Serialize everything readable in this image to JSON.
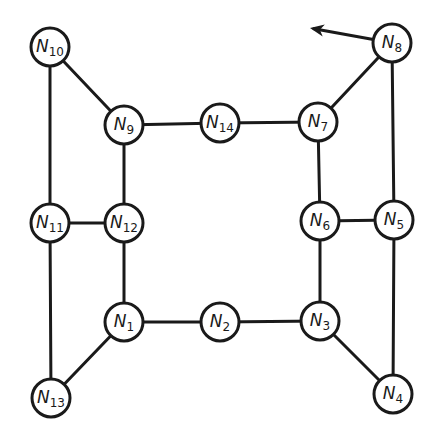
{
  "diagram": {
    "type": "graph",
    "nodes": [
      {
        "id": "N1",
        "label": "N",
        "sub": "1",
        "x": 124,
        "y": 322
      },
      {
        "id": "N2",
        "label": "N",
        "sub": "2",
        "x": 220,
        "y": 322
      },
      {
        "id": "N3",
        "label": "N",
        "sub": "3",
        "x": 320,
        "y": 321
      },
      {
        "id": "N4",
        "label": "N",
        "sub": "4",
        "x": 393,
        "y": 394
      },
      {
        "id": "N5",
        "label": "N",
        "sub": "5",
        "x": 394,
        "y": 220
      },
      {
        "id": "N6",
        "label": "N",
        "sub": "6",
        "x": 320,
        "y": 221
      },
      {
        "id": "N7",
        "label": "N",
        "sub": "7",
        "x": 318,
        "y": 122
      },
      {
        "id": "N8",
        "label": "N",
        "sub": "8",
        "x": 392,
        "y": 43
      },
      {
        "id": "N9",
        "label": "N",
        "sub": "9",
        "x": 124,
        "y": 125
      },
      {
        "id": "N10",
        "label": "N",
        "sub": "10",
        "x": 50,
        "y": 47
      },
      {
        "id": "N11",
        "label": "N",
        "sub": "11",
        "x": 50,
        "y": 223
      },
      {
        "id": "N12",
        "label": "N",
        "sub": "12",
        "x": 124,
        "y": 223
      },
      {
        "id": "N13",
        "label": "N",
        "sub": "13",
        "x": 51,
        "y": 398
      },
      {
        "id": "N14",
        "label": "N",
        "sub": "14",
        "x": 220,
        "y": 123
      }
    ],
    "edges": [
      [
        "N10",
        "N9"
      ],
      [
        "N10",
        "N11"
      ],
      [
        "N9",
        "N14"
      ],
      [
        "N14",
        "N7"
      ],
      [
        "N7",
        "N8"
      ],
      [
        "N8",
        "N5"
      ],
      [
        "N9",
        "N12"
      ],
      [
        "N11",
        "N12"
      ],
      [
        "N11",
        "N13"
      ],
      [
        "N12",
        "N1"
      ],
      [
        "N7",
        "N6"
      ],
      [
        "N6",
        "N5"
      ],
      [
        "N5",
        "N4"
      ],
      [
        "N6",
        "N3"
      ],
      [
        "N1",
        "N2"
      ],
      [
        "N2",
        "N3"
      ],
      [
        "N1",
        "N13"
      ],
      [
        "N3",
        "N4"
      ]
    ],
    "arrow": {
      "from": "N8",
      "to_x": 310,
      "to_y": 28
    },
    "node_radius": 19,
    "stroke_color": "#1a1a1a",
    "background": "#ffffff"
  }
}
